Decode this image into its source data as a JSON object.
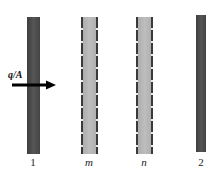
{
  "diagram": {
    "plates": [
      {
        "id": "1",
        "label": "1",
        "type": "solid-surface",
        "color": "#4a4a4a"
      },
      {
        "id": "m",
        "label": "m",
        "type": "radiation-shield",
        "color": "#b5b5b5"
      },
      {
        "id": "n",
        "label": "n",
        "type": "radiation-shield",
        "color": "#b5b5b5"
      },
      {
        "id": "2",
        "label": "2",
        "type": "solid-surface",
        "color": "#4a4a4a"
      }
    ],
    "flux": {
      "label": "q/A",
      "direction": "right",
      "color": "#000000"
    },
    "background": "#ffffff"
  }
}
